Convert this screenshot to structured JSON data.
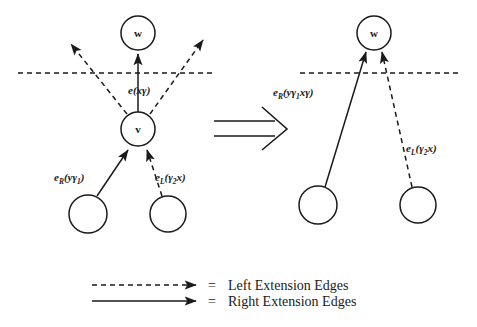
{
  "figure": {
    "colors": {
      "ink": "#1a1a1a",
      "background": "#ffffff"
    },
    "left_panel": {
      "nodes": [
        {
          "id": "w",
          "label": "w",
          "cx": 138,
          "cy": 33,
          "r": 17
        },
        {
          "id": "v",
          "label": "v",
          "cx": 138,
          "cy": 129,
          "r": 17
        },
        {
          "id": "bl",
          "label": "",
          "cx": 88,
          "cy": 214,
          "r": 19
        },
        {
          "id": "br",
          "label": "",
          "cx": 168,
          "cy": 214,
          "r": 18
        }
      ],
      "edge_labels": {
        "center": {
          "base": "e",
          "sub": "",
          "args": "(xγ)",
          "x": 128,
          "y": 94
        },
        "lower_left": {
          "base": "e",
          "sub": "R",
          "args": "(yγ",
          "sub2": "1",
          "args_end": ")",
          "x": 54,
          "y": 181
        },
        "lower_right": {
          "base": "e",
          "sub": "L",
          "args": "(γ",
          "sub2": "2",
          "args_end": "x)",
          "x": 155,
          "y": 181
        }
      },
      "dashed_baseline": {
        "x1": 18,
        "x2": 215,
        "y": 73
      }
    },
    "transform_arrow": {
      "name": "implies-arrow",
      "x1": 214,
      "x2": 286,
      "y": 130
    },
    "right_panel": {
      "nodes": [
        {
          "id": "w",
          "label": "w",
          "cx": 374,
          "cy": 33,
          "r": 17
        },
        {
          "id": "bl",
          "label": "",
          "cx": 318,
          "cy": 205,
          "r": 19
        },
        {
          "id": "br",
          "label": "",
          "cx": 418,
          "cy": 205,
          "r": 18
        }
      ],
      "edge_labels": {
        "left": {
          "base": "e",
          "sub": "R",
          "args": "(yγ",
          "sub2": "1",
          "args_end": "xγ)",
          "x": 273,
          "y": 96
        },
        "right": {
          "base": "e",
          "sub": "L",
          "args": "(γ",
          "sub2": "2",
          "args_end": "x)",
          "x": 406,
          "y": 152
        }
      },
      "dashed_baseline": {
        "x1": 300,
        "x2": 462,
        "y": 73
      }
    },
    "legend": {
      "items": [
        {
          "style": "dashed",
          "equals": "=",
          "label": "Left Extension Edges",
          "y": 285
        },
        {
          "style": "solid",
          "equals": "=",
          "label": "Right Extension Edges",
          "y": 301
        }
      ],
      "sample_x1": 92,
      "sample_x2": 196,
      "equals_x": 210,
      "label_x": 228
    }
  }
}
